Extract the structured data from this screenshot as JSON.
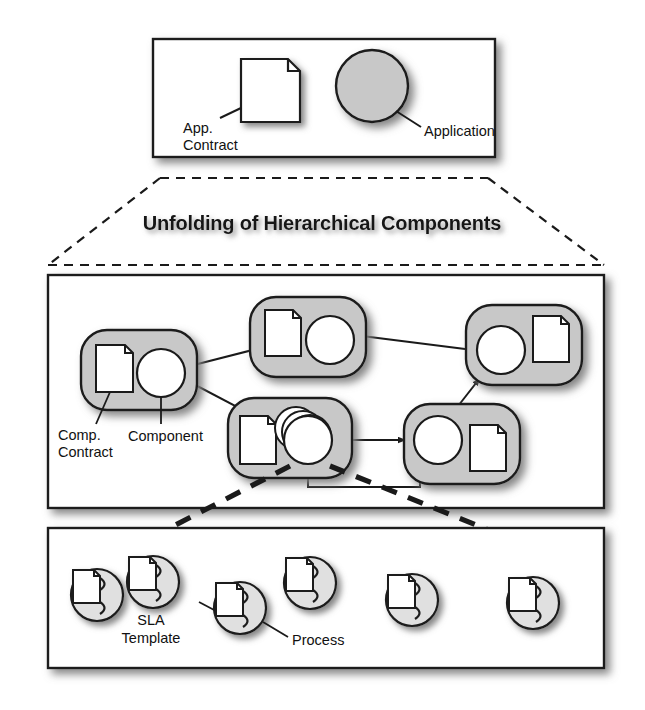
{
  "figure": {
    "title": "Unfolding of Hierarchical Components",
    "background_color": "#ffffff",
    "stroke_color": "#1a1a1a",
    "node_fill_color": "#c8c8c8",
    "inner_fill_color": "#ffffff",
    "shadow_color": "#9a9a9a"
  },
  "layers": {
    "application_layer": {
      "name": "application-layer",
      "labels": [
        {
          "id": "app-contract",
          "text_lines": [
            "App.",
            "Contract"
          ],
          "icon": "document-icon"
        },
        {
          "id": "application",
          "text_lines": [
            "Application"
          ],
          "icon": "circle-node-icon"
        }
      ]
    },
    "component_layer": {
      "name": "component-layer",
      "labels": [
        {
          "id": "comp-contract",
          "text_lines": [
            "Comp.",
            "Contract"
          ],
          "icon": "document-icon"
        },
        {
          "id": "component",
          "text_lines": [
            "Component"
          ],
          "icon": "circle-node-icon"
        }
      ],
      "nodes": [
        {
          "id": "component-1",
          "doc_side": "left",
          "circle": "single"
        },
        {
          "id": "component-2",
          "doc_side": "left",
          "circle": "single"
        },
        {
          "id": "component-3",
          "doc_side": "right",
          "circle": "single"
        },
        {
          "id": "component-4",
          "doc_side": "left",
          "circle": "stack"
        },
        {
          "id": "component-5",
          "doc_side": "right",
          "circle": "single"
        }
      ],
      "connector_count": 6
    },
    "process_layer": {
      "name": "process-layer",
      "labels": [
        {
          "id": "sla-template",
          "text_lines": [
            "SLA",
            "Template"
          ],
          "icon": "document-icon"
        },
        {
          "id": "process",
          "text_lines": [
            "Process"
          ],
          "icon": "process-icon"
        }
      ],
      "process_count": 6
    }
  },
  "expansion_connectors": {
    "top_to_middle": {
      "style": "dashed-thin",
      "description": "fan from application box down to component box"
    },
    "middle_to_bottom": {
      "style": "dashed-thick",
      "description": "fan from stacked component down to process box"
    }
  }
}
